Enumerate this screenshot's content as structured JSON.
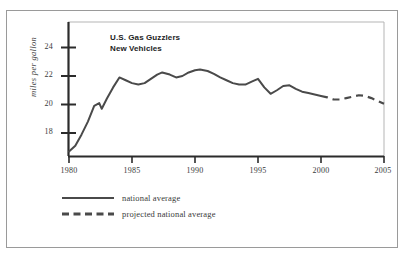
{
  "chart_data": {
    "type": "line",
    "title": "U.S. Gas Guzzlers",
    "subtitle": "New Vehicles",
    "xlabel": "",
    "ylabel": "miles per gallon",
    "xlim": [
      1980,
      2005
    ],
    "ylim": [
      16.2,
      25.2
    ],
    "xticks": [
      1980,
      1985,
      1990,
      1995,
      2000,
      2005
    ],
    "yticks": [
      18,
      20,
      22,
      24
    ],
    "grid": false,
    "legend_position": "below-axes-left",
    "series": [
      {
        "name": "national average",
        "style": "solid",
        "color": "#4a4a4a",
        "x": [
          1980,
          1980.5,
          1981,
          1981.5,
          1982,
          1982.4,
          1982.6,
          1983,
          1983.5,
          1984,
          1984.5,
          1985,
          1985.5,
          1986,
          1986.5,
          1987,
          1987.4,
          1988,
          1988.5,
          1989,
          1989.5,
          1990,
          1990.4,
          1991,
          1991.5,
          1992,
          1992.5,
          1993,
          1993.5,
          1994,
          1994.5,
          1995,
          1995.5,
          1996,
          1996.5,
          1997,
          1997.5,
          1998,
          1998.5,
          1999,
          1999.5,
          2000
        ],
        "y": [
          16.7,
          17.1,
          17.9,
          18.8,
          19.9,
          20.1,
          19.7,
          20.4,
          21.2,
          21.9,
          21.7,
          21.5,
          21.4,
          21.5,
          21.8,
          22.1,
          22.25,
          22.1,
          21.9,
          22.0,
          22.25,
          22.4,
          22.45,
          22.35,
          22.15,
          21.9,
          21.7,
          21.5,
          21.4,
          21.4,
          21.6,
          21.8,
          21.2,
          20.75,
          21.0,
          21.3,
          21.35,
          21.1,
          20.9,
          20.8,
          20.7,
          20.6
        ]
      },
      {
        "name": "projected national average",
        "style": "dashed",
        "color": "#4a4a4a",
        "x": [
          2000,
          2000.5,
          2001,
          2001.5,
          2002,
          2002.5,
          2003,
          2003.5,
          2004,
          2004.5,
          2005
        ],
        "y": [
          20.6,
          20.5,
          20.35,
          20.35,
          20.45,
          20.55,
          20.65,
          20.6,
          20.45,
          20.25,
          20.05
        ]
      }
    ],
    "annotations": []
  },
  "legend": {
    "items": [
      {
        "label": "national average",
        "style": "solid"
      },
      {
        "label": "projected national average",
        "style": "dashed"
      }
    ]
  },
  "axis": {
    "y_title": "miles per gallon",
    "y_tick_labels": [
      "24",
      "22",
      "20",
      "18"
    ],
    "x_tick_labels": [
      "1980",
      "1985",
      "1990",
      "1995",
      "2000",
      "2005"
    ]
  },
  "title": {
    "line1": "U.S. Gas Guzzlers",
    "line2": "New Vehicles"
  },
  "colors": {
    "line": "#4a4a4a",
    "axis": "#2b2b2b",
    "frame": "#9a9a9a",
    "text": "#3a3a3a"
  }
}
